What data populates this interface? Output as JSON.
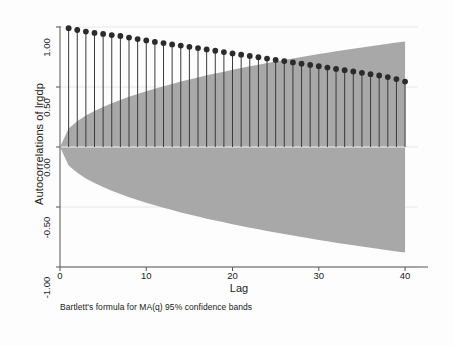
{
  "chart_data": {
    "type": "line",
    "subtype": "autocorrelation-stem-plot",
    "title": "",
    "xlabel": "Lag",
    "ylabel": "Autocorrelations of lrgdp",
    "caption": "Bartlett's formula for MA(q) 95% confidence bands",
    "xlim": [
      0,
      41.5
    ],
    "ylim": [
      -1.0,
      1.0
    ],
    "xticks": [
      0,
      10,
      20,
      30,
      40
    ],
    "xtick_labels": [
      "0",
      "10",
      "20",
      "30",
      "40"
    ],
    "yticks": [
      1.0,
      0.5,
      0.0,
      -0.5,
      -1.0
    ],
    "ytick_labels": [
      "1.00",
      "0.50",
      "0.00",
      "-0.50",
      "-1.00"
    ],
    "grid": true,
    "grid_axis": "y",
    "legend": null,
    "marker": "filled-circle",
    "marker_color": "#2b2b2b",
    "stem_color": "#3a3a3a",
    "band_color": "#a8a8a8",
    "band_label": "95% confidence band (Bartlett)",
    "x": [
      1,
      2,
      3,
      4,
      5,
      6,
      7,
      8,
      9,
      10,
      11,
      12,
      13,
      14,
      15,
      16,
      17,
      18,
      19,
      20,
      21,
      22,
      23,
      24,
      25,
      26,
      27,
      28,
      29,
      30,
      31,
      32,
      33,
      34,
      35,
      36,
      37,
      38,
      39,
      40
    ],
    "values": [
      0.99,
      0.975,
      0.962,
      0.951,
      0.942,
      0.933,
      0.925,
      0.912,
      0.899,
      0.888,
      0.876,
      0.866,
      0.855,
      0.845,
      0.835,
      0.824,
      0.813,
      0.802,
      0.791,
      0.78,
      0.769,
      0.759,
      0.748,
      0.737,
      0.726,
      0.716,
      0.705,
      0.694,
      0.684,
      0.673,
      0.662,
      0.651,
      0.64,
      0.629,
      0.618,
      0.607,
      0.596,
      0.583,
      0.566,
      0.545
    ],
    "band_upper": [
      0.155,
      0.215,
      0.262,
      0.3,
      0.334,
      0.364,
      0.392,
      0.418,
      0.442,
      0.465,
      0.486,
      0.507,
      0.526,
      0.545,
      0.563,
      0.58,
      0.597,
      0.613,
      0.628,
      0.643,
      0.658,
      0.672,
      0.686,
      0.7,
      0.713,
      0.726,
      0.738,
      0.75,
      0.762,
      0.774,
      0.786,
      0.797,
      0.808,
      0.819,
      0.829,
      0.84,
      0.85,
      0.86,
      0.87,
      0.88
    ],
    "band_lower": [
      -0.155,
      -0.215,
      -0.262,
      -0.3,
      -0.334,
      -0.364,
      -0.392,
      -0.418,
      -0.442,
      -0.465,
      -0.486,
      -0.507,
      -0.526,
      -0.545,
      -0.563,
      -0.58,
      -0.597,
      -0.613,
      -0.628,
      -0.643,
      -0.658,
      -0.672,
      -0.686,
      -0.7,
      -0.713,
      -0.726,
      -0.738,
      -0.75,
      -0.762,
      -0.774,
      -0.786,
      -0.797,
      -0.808,
      -0.819,
      -0.829,
      -0.84,
      -0.85,
      -0.86,
      -0.87,
      -0.88
    ]
  },
  "axes": {
    "x_title": "Lag",
    "y_title": "Autocorrelations of lrgdp",
    "xtick_labels": [
      "0",
      "10",
      "20",
      "30",
      "40"
    ],
    "ytick_labels": [
      "1.00",
      "0.50",
      "0.00",
      "-0.50",
      "-1.00"
    ]
  },
  "note": {
    "text": "Bartlett's formula for MA(q) 95% confidence bands"
  },
  "colors": {
    "band": "#a8a8a8",
    "marker": "#2b2b2b",
    "stem": "#3a3a3a",
    "axis": "#555555",
    "grid": "#e8e8e8",
    "background": "#fdfdfd"
  }
}
